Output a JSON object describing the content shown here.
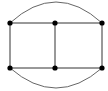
{
  "diagram": {
    "type": "graph",
    "background": "#ffffff",
    "edge_color": "#333333",
    "arc_color": "#555555",
    "node_color": "#000000",
    "node_radius": 2.6,
    "nodes": [
      {
        "id": "n1",
        "label": "top-left",
        "x": 10,
        "y": 23
      },
      {
        "id": "n2",
        "label": "top-middle",
        "x": 55,
        "y": 23
      },
      {
        "id": "n3",
        "label": "top-right",
        "x": 102,
        "y": 23
      },
      {
        "id": "n4",
        "label": "bottom-left",
        "x": 10,
        "y": 68
      },
      {
        "id": "n5",
        "label": "bottom-middle",
        "x": 55,
        "y": 68
      },
      {
        "id": "n6",
        "label": "bottom-right",
        "x": 102,
        "y": 68
      }
    ],
    "edges": [
      {
        "from": "n1",
        "to": "n2",
        "kind": "line"
      },
      {
        "from": "n2",
        "to": "n3",
        "kind": "line"
      },
      {
        "from": "n4",
        "to": "n5",
        "kind": "line"
      },
      {
        "from": "n5",
        "to": "n6",
        "kind": "line"
      },
      {
        "from": "n1",
        "to": "n4",
        "kind": "line"
      },
      {
        "from": "n2",
        "to": "n5",
        "kind": "line"
      },
      {
        "from": "n3",
        "to": "n6",
        "kind": "line"
      },
      {
        "from": "n1",
        "to": "n3",
        "kind": "arc",
        "apex_y": 2
      },
      {
        "from": "n4",
        "to": "n6",
        "kind": "arc",
        "apex_y": 88
      }
    ]
  }
}
